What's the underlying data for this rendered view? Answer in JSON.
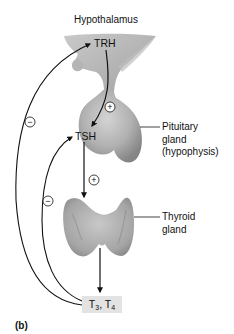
{
  "diagram": {
    "panel_label": "(b)",
    "structures": {
      "hypothalamus": {
        "label": "Hypothalamus"
      },
      "pituitary": {
        "label_lines": [
          "Pituitary",
          "gland",
          "(hypophysis)"
        ]
      },
      "thyroid": {
        "label_lines": [
          "Thyroid",
          "gland"
        ]
      }
    },
    "hormones": {
      "trh": "TRH",
      "tsh": "TSH",
      "t3_t4": {
        "t3_base": "T",
        "t3_sub": "3",
        "sep": ", ",
        "t4_base": "T",
        "t4_sub": "4"
      }
    },
    "signs": {
      "stimulate": "+",
      "inhibit": "−"
    },
    "arrows": [
      {
        "from": "TRH",
        "to": "TSH",
        "effect": "+"
      },
      {
        "from": "TSH",
        "to": "Thyroid gland",
        "effect": "+"
      },
      {
        "from": "Thyroid gland",
        "to": "T3, T4",
        "effect": ""
      },
      {
        "from": "T3, T4",
        "to": "TRH",
        "effect": "−"
      },
      {
        "from": "T3, T4",
        "to": "TSH",
        "effect": "−"
      }
    ],
    "colors": {
      "tissue": "#a9a9a9",
      "tissue_light": "#d0d0d0",
      "tissue_dark": "#7d7d7d",
      "line": "#111111",
      "box": "#e3e3e3"
    }
  }
}
